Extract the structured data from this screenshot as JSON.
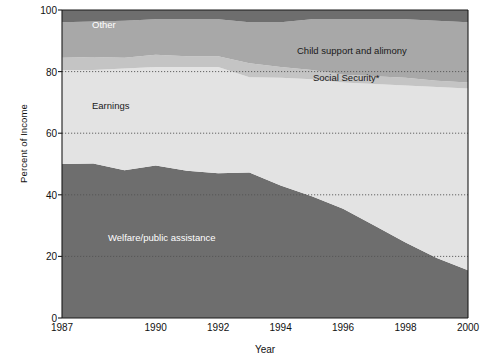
{
  "chart_data": {
    "type": "area",
    "stacked": true,
    "title": "",
    "xlabel": "Year",
    "ylabel": "Percent of Income",
    "xlim": [
      1987,
      2000
    ],
    "ylim": [
      0,
      100
    ],
    "grid": true,
    "grid_style": "dotted",
    "x": [
      1987,
      1988,
      1989,
      1990,
      1991,
      1992,
      1993,
      1994,
      1995,
      1996,
      1997,
      1998,
      1999,
      2000
    ],
    "xticks": [
      1987,
      1990,
      1992,
      1994,
      1996,
      1998,
      2000
    ],
    "xtick_labels": [
      "1987",
      "1990",
      "1992",
      "1994",
      "1996",
      "1998",
      "2000"
    ],
    "yticks": [
      0,
      20,
      40,
      60,
      80,
      100
    ],
    "ytick_labels": [
      "0",
      "20",
      "40",
      "60",
      "80",
      "100"
    ],
    "legend_position": "inline-annotations",
    "series": [
      {
        "name": "Welfare/public assistance",
        "color": "#6e6e6e",
        "label_color": "#ffffff",
        "values": [
          50.0,
          50.2,
          48.0,
          49.5,
          47.8,
          47.0,
          47.2,
          43.0,
          39.5,
          35.5,
          30.0,
          24.5,
          19.5,
          15.5
        ]
      },
      {
        "name": "Earnings",
        "color": "#e3e3e3",
        "label_color": "#1a1a1a",
        "values": [
          30.5,
          30.3,
          33.0,
          32.0,
          33.7,
          34.5,
          31.0,
          35.0,
          38.0,
          41.0,
          46.0,
          51.0,
          55.5,
          59.0
        ]
      },
      {
        "name": "Social Security*",
        "color": "#c4c4c4",
        "label_color": "#1a1a1a",
        "values": [
          4.0,
          4.2,
          3.5,
          4.0,
          3.5,
          3.5,
          4.5,
          3.5,
          3.0,
          2.5,
          2.5,
          2.5,
          2.0,
          2.0
        ]
      },
      {
        "name": "Child support and alimony",
        "color": "#a8a8a8",
        "label_color": "#1a1a1a",
        "values": [
          11.5,
          11.6,
          12.0,
          11.5,
          12.0,
          12.0,
          13.3,
          14.5,
          16.5,
          18.0,
          18.5,
          19.0,
          19.5,
          19.5
        ]
      },
      {
        "name": "Other",
        "color": "#6e6e6e",
        "label_color": "#ffffff",
        "values": [
          4.0,
          3.7,
          3.5,
          3.0,
          3.0,
          3.0,
          4.0,
          4.0,
          3.0,
          3.0,
          3.0,
          3.0,
          3.5,
          4.0
        ]
      }
    ],
    "annotations": [
      {
        "text": "Other",
        "x_px": 92,
        "y_px": 19,
        "color": "#ffffff"
      },
      {
        "text": "Child support and alimony",
        "x_px": 297,
        "y_px": 45,
        "color": "#1a1a1a"
      },
      {
        "text": "Social Security*",
        "x_px": 313,
        "y_px": 72,
        "color": "#1a1a1a"
      },
      {
        "text": "Earnings",
        "x_px": 92,
        "y_px": 100,
        "color": "#1a1a1a"
      },
      {
        "text": "Welfare/public assistance",
        "x_px": 108,
        "y_px": 232,
        "color": "#ffffff"
      }
    ]
  },
  "axis": {
    "y_title": "Percent of Income",
    "x_title": "Year"
  },
  "colors": {
    "welfare": "#6e6e6e",
    "earnings": "#e3e3e3",
    "social_security": "#c4c4c4",
    "child_support": "#a8a8a8",
    "other": "#6e6e6e",
    "axis": "#1a1a1a",
    "grid": "#555555"
  }
}
